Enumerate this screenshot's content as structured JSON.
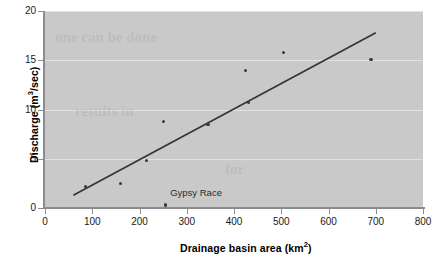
{
  "chart_data": {
    "type": "scatter",
    "title": "",
    "xlabel": "Drainage basin area (km2)",
    "ylabel": "Discharge (m3/sec)",
    "xlim": [
      0,
      800
    ],
    "ylim": [
      0,
      20
    ],
    "xticks": [
      0,
      100,
      200,
      300,
      400,
      500,
      600,
      700,
      800
    ],
    "yticks": [
      0,
      5,
      10,
      15,
      20
    ],
    "grid": "horizontal",
    "legend": "none",
    "points": [
      {
        "x": 85,
        "y": 2.2
      },
      {
        "x": 160,
        "y": 2.5
      },
      {
        "x": 215,
        "y": 4.8
      },
      {
        "x": 250,
        "y": 8.8
      },
      {
        "x": 345,
        "y": 8.5
      },
      {
        "x": 430,
        "y": 10.7
      },
      {
        "x": 425,
        "y": 14.0
      },
      {
        "x": 505,
        "y": 15.8
      },
      {
        "x": 690,
        "y": 15.1
      },
      {
        "x": 255,
        "y": 0.3
      }
    ],
    "trend_line": {
      "x1": 60,
      "y1": 1.3,
      "x2": 700,
      "y2": 17.8
    },
    "annotations": [
      {
        "label": "Gypsy Race",
        "x": 265,
        "y": 1.55
      }
    ]
  },
  "axes": {
    "y_title_main": "Discharge (m",
    "y_title_sup": "3",
    "y_title_tail": "/sec)",
    "x_title_main": "Drainage basin area (km",
    "x_title_sup": "2",
    "x_title_tail": ")"
  },
  "bleed_text": {
    "line1": "one can be done",
    "line2": "results in",
    "line3": "for"
  },
  "colors": {
    "plot_background": "#c9c9c9",
    "gridline": "#e2e2e2",
    "axis": "#8c8c8c",
    "point": "#3a3a3a",
    "trend": "#333333",
    "text": "#000000"
  }
}
